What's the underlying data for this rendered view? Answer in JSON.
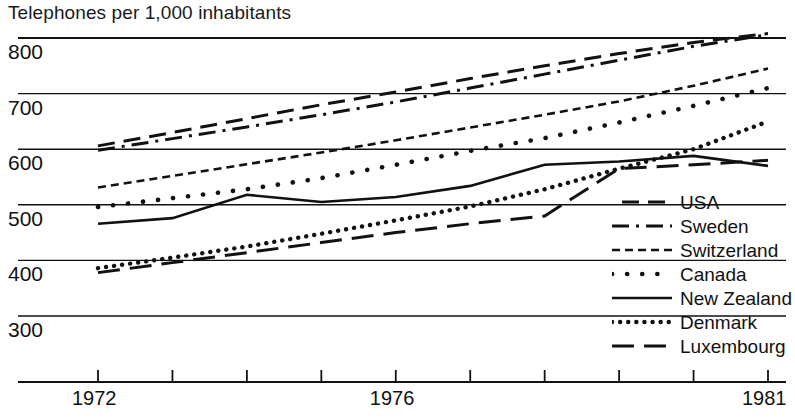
{
  "chart_data": {
    "type": "line",
    "title": "Telephones per 1,000 inhabitants",
    "xlabel": "",
    "ylabel": "Telephones per 1,000 inhabitants",
    "x": [
      1972,
      1973,
      1974,
      1975,
      1976,
      1977,
      1978,
      1979,
      1980,
      1981
    ],
    "xlim": [
      1971.6,
      1981.4
    ],
    "ylim": [
      255,
      830
    ],
    "yticks": [
      300,
      400,
      500,
      600,
      700,
      800
    ],
    "xticks": [
      1972,
      1973,
      1974,
      1975,
      1976,
      1977,
      1978,
      1979,
      1980,
      1981
    ],
    "xtick_labels_shown": [
      "1972",
      "1976",
      "1981"
    ],
    "grid": true,
    "legend_position": "right-inside",
    "series": [
      {
        "name": "USA",
        "style": "dashed",
        "values": [
          606,
          630,
          655,
          680,
          703,
          727,
          750,
          772,
          792,
          808
        ]
      },
      {
        "name": "Sweden",
        "style": "dash-dot",
        "values": [
          598,
          619,
          640,
          662,
          685,
          710,
          735,
          760,
          785,
          806
        ]
      },
      {
        "name": "Switzerland",
        "style": "short-dash",
        "values": [
          531,
          552,
          573,
          594,
          616,
          639,
          662,
          686,
          714,
          745
        ]
      },
      {
        "name": "Canada",
        "style": "sparse-dots",
        "values": [
          496,
          512,
          528,
          548,
          572,
          597,
          620,
          648,
          678,
          710
        ]
      },
      {
        "name": "New Zealand",
        "style": "solid",
        "values": [
          466,
          476,
          518,
          505,
          514,
          534,
          572,
          578,
          588,
          570
        ]
      },
      {
        "name": "Denmark",
        "style": "dense-dots",
        "values": [
          386,
          405,
          425,
          448,
          472,
          497,
          528,
          565,
          600,
          650
        ]
      },
      {
        "name": "Luxembourg",
        "style": "long-dash",
        "values": [
          378,
          396,
          414,
          432,
          450,
          466,
          480,
          565,
          572,
          580
        ]
      }
    ]
  },
  "axes": {
    "ytick_labels": [
      "800",
      "700",
      "600",
      "500",
      "400",
      "300"
    ],
    "xtick_labels": [
      "1972",
      "1976",
      "1981"
    ]
  },
  "legend": {
    "entries": [
      {
        "label": "USA",
        "key": "dashed"
      },
      {
        "label": "Sweden",
        "key": "dash-dot"
      },
      {
        "label": "Switzerland",
        "key": "short-dash"
      },
      {
        "label": "Canada",
        "key": "sparse-dots"
      },
      {
        "label": "New Zealand",
        "key": "solid"
      },
      {
        "label": "Denmark",
        "key": "dense-dots"
      },
      {
        "label": "Luxembourg",
        "key": "long-dash"
      }
    ]
  },
  "colors": {
    "ink": "#111111",
    "grid": "#2a2a2a",
    "background": "#ffffff"
  }
}
